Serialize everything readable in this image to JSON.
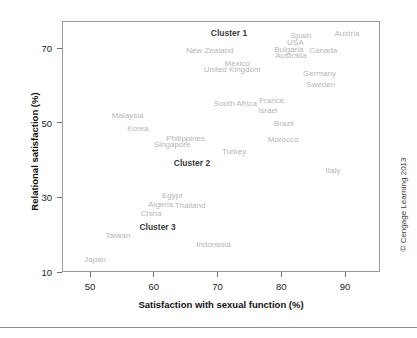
{
  "figure": {
    "credit": "© Cengage Learning 2013"
  },
  "axes": {
    "xlabel": "Satisfaction with sexual function (%)",
    "ylabel": "Relational satisfaction (%)",
    "xticks": [
      "50",
      "60",
      "70",
      "80",
      "90"
    ],
    "yticks": [
      "70",
      "50",
      "30",
      "10"
    ]
  },
  "chart_data": {
    "type": "scatter",
    "title": "",
    "xlabel": "Satisfaction with sexual function (%)",
    "ylabel": "Relational satisfaction (%)",
    "xlim": [
      45.6,
      95.5
    ],
    "ylim": [
      9.6,
      77.2
    ],
    "xticks": [
      50,
      60,
      70,
      80,
      90
    ],
    "yticks": [
      70,
      50,
      30,
      10
    ],
    "grid": false,
    "legend": null,
    "point_style": "text-labels-only",
    "points": [
      {
        "label": "Austria",
        "x": 90.3,
        "y": 74.0,
        "cluster": "Cluster 1"
      },
      {
        "label": "Spain",
        "x": 83.1,
        "y": 73.5,
        "cluster": "Cluster 1"
      },
      {
        "label": "USA",
        "x": 82.2,
        "y": 71.5,
        "cluster": "Cluster 1"
      },
      {
        "label": "Bulgaria",
        "x": 81.2,
        "y": 69.8,
        "cluster": "Cluster 1"
      },
      {
        "label": "Canada",
        "x": 86.6,
        "y": 69.4,
        "cluster": "Cluster 1"
      },
      {
        "label": "Australia",
        "x": 81.5,
        "y": 68.2,
        "cluster": "Cluster 1"
      },
      {
        "label": "New Zealand",
        "x": 68.8,
        "y": 69.5,
        "cluster": "Cluster 1"
      },
      {
        "label": "Mexico",
        "x": 73.1,
        "y": 66.0,
        "cluster": "Cluster 1"
      },
      {
        "label": "United Kingdom",
        "x": 72.3,
        "y": 64.4,
        "cluster": "Cluster 1"
      },
      {
        "label": "Germany",
        "x": 86.0,
        "y": 63.3,
        "cluster": "Cluster 1"
      },
      {
        "label": "Sweden",
        "x": 86.2,
        "y": 60.3,
        "cluster": "Cluster 1"
      },
      {
        "label": "France",
        "x": 78.5,
        "y": 56.0,
        "cluster": "Cluster 2"
      },
      {
        "label": "South Africa",
        "x": 72.8,
        "y": 55.2,
        "cluster": "Cluster 2"
      },
      {
        "label": "Israel",
        "x": 77.9,
        "y": 53.3,
        "cluster": "Cluster 2"
      },
      {
        "label": "Malaysia",
        "x": 55.9,
        "y": 52.1,
        "cluster": "Cluster 2"
      },
      {
        "label": "Brazil",
        "x": 80.4,
        "y": 49.8,
        "cluster": "Cluster 2"
      },
      {
        "label": "Korea",
        "x": 57.5,
        "y": 48.5,
        "cluster": "Cluster 2"
      },
      {
        "label": "Philippines",
        "x": 65.0,
        "y": 45.9,
        "cluster": "Cluster 2"
      },
      {
        "label": "Morocco",
        "x": 80.3,
        "y": 45.6,
        "cluster": "Cluster 2"
      },
      {
        "label": "Singapore",
        "x": 62.9,
        "y": 44.4,
        "cluster": "Cluster 2"
      },
      {
        "label": "Turkey",
        "x": 72.6,
        "y": 42.4,
        "cluster": "Cluster 2"
      },
      {
        "label": "Italy",
        "x": 88.1,
        "y": 37.2,
        "cluster": "Cluster 2"
      },
      {
        "label": "Egypt",
        "x": 62.9,
        "y": 30.5,
        "cluster": "Cluster 3"
      },
      {
        "label": "Algeria",
        "x": 61.1,
        "y": 28.2,
        "cluster": "Cluster 3"
      },
      {
        "label": "Thailand",
        "x": 65.7,
        "y": 28.0,
        "cluster": "Cluster 3"
      },
      {
        "label": "China",
        "x": 59.6,
        "y": 25.8,
        "cluster": "Cluster 3"
      },
      {
        "label": "Taiwan",
        "x": 54.4,
        "y": 19.9,
        "cluster": "Cluster 3"
      },
      {
        "label": "Indonesia",
        "x": 69.4,
        "y": 17.4,
        "cluster": "Cluster 3"
      },
      {
        "label": "Japan",
        "x": 50.8,
        "y": 13.6,
        "cluster": "Cluster 3"
      }
    ],
    "annotations": [
      {
        "label": "Cluster 1",
        "x": 71.8,
        "y": 74.1
      },
      {
        "label": "Cluster 2",
        "x": 66.0,
        "y": 39.3
      },
      {
        "label": "Cluster 3",
        "x": 60.6,
        "y": 22.0
      }
    ]
  }
}
